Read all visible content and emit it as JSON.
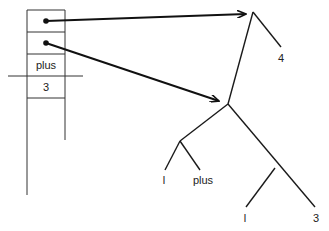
{
  "stack": {
    "cells": [
      {
        "type": "pointer",
        "label": ""
      },
      {
        "type": "pointer",
        "label": ""
      },
      {
        "type": "value",
        "label": "plus"
      },
      {
        "type": "value",
        "label": "3"
      }
    ],
    "divider_after_cell": 2
  },
  "tree": {
    "root": {
      "children": [
        "node_a",
        "leaf_4"
      ]
    },
    "leaves": {
      "leaf_4": "4",
      "leaf_l1": "l",
      "leaf_plus": "plus",
      "leaf_l2": "l",
      "leaf_3": "3"
    },
    "nodes": {
      "node_a": {
        "children": [
          "node_b",
          "node_c"
        ]
      },
      "node_b": {
        "children": [
          "leaf_l1",
          "leaf_plus"
        ]
      },
      "node_c": {
        "children": [
          "leaf_l2",
          "leaf_3"
        ]
      }
    }
  },
  "arrows": [
    {
      "from": "stack.cell_0",
      "to": "tree.root"
    },
    {
      "from": "stack.cell_1",
      "to": "tree.node_a"
    }
  ],
  "colors": {
    "line": "#1a1a1a",
    "background": "#ffffff"
  }
}
